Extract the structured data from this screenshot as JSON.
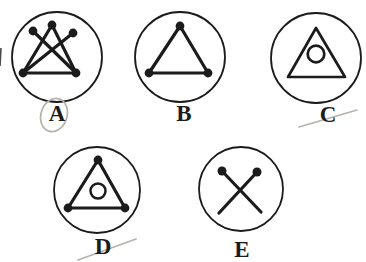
{
  "colors": {
    "ink": "#1b1b1b",
    "pencil": "#b7b2aa",
    "background": "#ffffff"
  },
  "puzzle": {
    "description": "five circled geometric figures labeled A to E",
    "pencil_annotations": "oval drawn around A; strike marks through C and D"
  },
  "options": [
    {
      "id": "a",
      "label": "A",
      "figure": "five dots joined by four crossing lines above a base line",
      "circle": {
        "cx": 57,
        "cy": 57,
        "r": 45
      },
      "dot_r": 4.4,
      "dots": [
        [
          23,
          73
        ],
        [
          76,
          73
        ],
        [
          33,
          31
        ],
        [
          52,
          25
        ],
        [
          73,
          33
        ]
      ],
      "segments": [
        [
          23,
          73,
          76,
          73
        ],
        [
          23,
          73,
          52,
          25
        ],
        [
          23,
          73,
          73,
          33
        ],
        [
          76,
          73,
          52,
          25
        ],
        [
          76,
          73,
          33,
          31
        ]
      ],
      "label_pos": {
        "x": 57,
        "y": 121
      },
      "pencil_ellipse": {
        "cx": 54,
        "cy": 115,
        "rx": 13,
        "ry": 17,
        "rotate": 18
      }
    },
    {
      "id": "b",
      "label": "B",
      "figure": "triangle with dots at all three vertices",
      "circle": {
        "cx": 180,
        "cy": 57,
        "r": 45
      },
      "dot_r": 4.4,
      "dots": [
        [
          180,
          26
        ],
        [
          149,
          73
        ],
        [
          208,
          73
        ]
      ],
      "segments": [
        [
          180,
          26,
          149,
          73
        ],
        [
          149,
          73,
          208,
          73
        ],
        [
          208,
          73,
          180,
          26
        ]
      ],
      "label_pos": {
        "x": 184,
        "y": 121
      }
    },
    {
      "id": "c",
      "label": "C",
      "figure": "plain triangle with a small circle inside",
      "circle": {
        "cx": 316,
        "cy": 58,
        "r": 45
      },
      "triangle": [
        [
          316,
          28
        ],
        [
          288,
          77
        ],
        [
          345,
          77
        ]
      ],
      "inner_circle": {
        "cx": 316,
        "cy": 54,
        "r": 8.3,
        "stroke": 2.7
      },
      "label_pos": {
        "x": 328,
        "y": 122
      },
      "pencil_line": [
        299,
        127,
        357,
        110
      ]
    },
    {
      "id": "d",
      "label": "D",
      "figure": "triangle with vertex dots and a small circle inside",
      "circle": {
        "cx": 97,
        "cy": 190,
        "r": 43
      },
      "dot_r": 4.4,
      "dots": [
        [
          98,
          160
        ],
        [
          68,
          208
        ],
        [
          125,
          208
        ]
      ],
      "segments": [
        [
          98,
          160,
          68,
          208
        ],
        [
          68,
          208,
          125,
          208
        ],
        [
          125,
          208,
          98,
          160
        ]
      ],
      "inner_circle": {
        "cx": 98,
        "cy": 191,
        "r": 7.5,
        "stroke": 2.5
      },
      "label_pos": {
        "x": 103,
        "y": 254
      },
      "pencil_line": [
        78,
        260,
        136,
        239
      ]
    },
    {
      "id": "e",
      "label": "E",
      "figure": "two crossed lines with dots at their upper ends",
      "circle": {
        "cx": 241,
        "cy": 189,
        "r": 42
      },
      "dot_r": 4.5,
      "dots": [
        [
          222,
          171
        ],
        [
          257,
          172
        ]
      ],
      "segments": [
        [
          222,
          171,
          261,
          212
        ],
        [
          257,
          172,
          219,
          213
        ]
      ],
      "label_pos": {
        "x": 242,
        "y": 257
      }
    }
  ],
  "artifacts": {
    "left_edge_mark": [
      1,
      48,
      0,
      66
    ]
  }
}
